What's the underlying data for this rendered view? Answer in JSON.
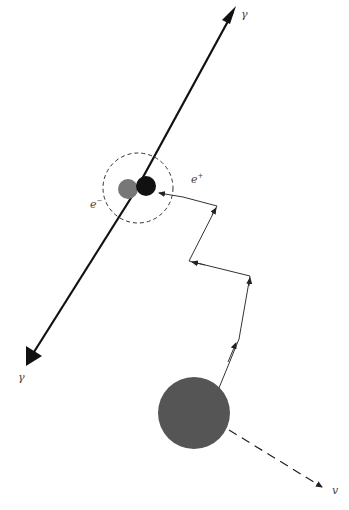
{
  "diagram": {
    "labels": {
      "gamma_top": "γ",
      "gamma_bottom": "γ",
      "electron": "e",
      "electron_sign": "−",
      "positron": "e",
      "positron_sign": "+",
      "neutrino": "v"
    },
    "nodes": [
      {
        "id": "nucleus",
        "shape": "circle",
        "color": "#555555"
      },
      {
        "id": "electron",
        "shape": "circle",
        "color": "#777777"
      },
      {
        "id": "positron",
        "shape": "circle",
        "color": "#111111"
      },
      {
        "id": "annihilation-region",
        "shape": "dashed-circle"
      }
    ],
    "edges": [
      {
        "from": "nucleus",
        "to": "positron",
        "style": "zigzag-arrow",
        "label": "e+"
      },
      {
        "from": "nucleus",
        "to": "neutrino",
        "style": "dashed-arrow",
        "label": "v"
      },
      {
        "from": "annihilation-region",
        "to": "gamma_top",
        "style": "thick-arrow",
        "label": "γ"
      },
      {
        "from": "annihilation-region",
        "to": "gamma_bottom",
        "style": "thick-arrow",
        "label": "γ"
      }
    ],
    "colors": {
      "line": "#222222",
      "nucleus": "#555555",
      "electron": "#777777",
      "positron": "#111111"
    }
  }
}
